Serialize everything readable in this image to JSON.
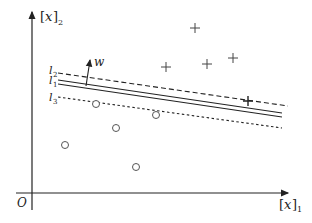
{
  "diagram": {
    "origin_label": "O",
    "x_axis": {
      "var": "x",
      "subscript": "1"
    },
    "y_axis": {
      "var": "x",
      "subscript": "2"
    },
    "normal_vector_label": "w",
    "lines": [
      {
        "name": "l",
        "subscript": "2",
        "style": "dashed"
      },
      {
        "name": "l",
        "subscript": "1",
        "style": "double-solid"
      },
      {
        "name": "l",
        "subscript": "3",
        "style": "dotted"
      }
    ],
    "positive_points": [
      [
        195,
        28
      ],
      [
        166,
        67
      ],
      [
        207,
        64
      ],
      [
        233,
        58
      ],
      [
        248,
        101
      ]
    ],
    "negative_points": [
      [
        96,
        104
      ],
      [
        156,
        115
      ],
      [
        116,
        128
      ],
      [
        65,
        145
      ],
      [
        136,
        167
      ]
    ],
    "colors": {
      "ink": "#222222",
      "points": "#555555"
    }
  }
}
